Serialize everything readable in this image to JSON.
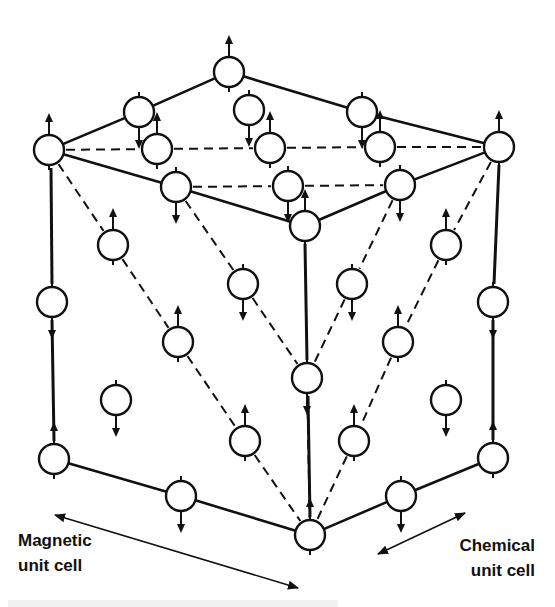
{
  "diagram": {
    "type": "crystal-spin-structure",
    "stroke_color": "#111111",
    "background": "#ffffff",
    "atom_radius": 15,
    "atoms": [
      {
        "x": 229,
        "y": 72,
        "spin": "up"
      },
      {
        "x": 139,
        "y": 112,
        "spin": "down"
      },
      {
        "x": 249,
        "y": 110,
        "spin": "down"
      },
      {
        "x": 362,
        "y": 112,
        "spin": "down"
      },
      {
        "x": 49,
        "y": 150,
        "spin": "up"
      },
      {
        "x": 157,
        "y": 149,
        "spin": "up"
      },
      {
        "x": 270,
        "y": 148,
        "spin": "up"
      },
      {
        "x": 380,
        "y": 147,
        "spin": "up"
      },
      {
        "x": 499,
        "y": 147,
        "spin": "up"
      },
      {
        "x": 176,
        "y": 187,
        "spin": "down"
      },
      {
        "x": 288,
        "y": 186,
        "spin": "down"
      },
      {
        "x": 400,
        "y": 185,
        "spin": "down"
      },
      {
        "x": 305,
        "y": 226,
        "spin": "up"
      },
      {
        "x": 113,
        "y": 245,
        "spin": "up"
      },
      {
        "x": 446,
        "y": 245,
        "spin": "up"
      },
      {
        "x": 243,
        "y": 284,
        "spin": "down"
      },
      {
        "x": 352,
        "y": 284,
        "spin": "down"
      },
      {
        "x": 52,
        "y": 302,
        "spin": "down"
      },
      {
        "x": 493,
        "y": 302,
        "spin": "down"
      },
      {
        "x": 178,
        "y": 342,
        "spin": "up"
      },
      {
        "x": 398,
        "y": 342,
        "spin": "up"
      },
      {
        "x": 307,
        "y": 378,
        "spin": "down"
      },
      {
        "x": 116,
        "y": 400,
        "spin": "down"
      },
      {
        "x": 446,
        "y": 400,
        "spin": "down"
      },
      {
        "x": 245,
        "y": 441,
        "spin": "up"
      },
      {
        "x": 354,
        "y": 441,
        "spin": "up"
      },
      {
        "x": 54,
        "y": 459,
        "spin": "up"
      },
      {
        "x": 493,
        "y": 458,
        "spin": "up"
      },
      {
        "x": 181,
        "y": 496,
        "spin": "down"
      },
      {
        "x": 401,
        "y": 496,
        "spin": "down"
      },
      {
        "x": 310,
        "y": 535,
        "spin": "up"
      }
    ],
    "solid_lines": [
      [
        49,
        150,
        139,
        112
      ],
      [
        139,
        112,
        229,
        72
      ],
      [
        229,
        72,
        362,
        112
      ],
      [
        362,
        112,
        499,
        147
      ],
      [
        49,
        150,
        176,
        187
      ],
      [
        176,
        187,
        305,
        226
      ],
      [
        305,
        226,
        400,
        185
      ],
      [
        400,
        185,
        499,
        147
      ],
      [
        54,
        459,
        181,
        496
      ],
      [
        181,
        496,
        310,
        535
      ],
      [
        310,
        535,
        401,
        496
      ],
      [
        401,
        496,
        493,
        458
      ]
    ],
    "dashed_lines": [
      [
        49,
        150,
        157,
        149
      ],
      [
        157,
        149,
        270,
        148
      ],
      [
        270,
        148,
        380,
        147
      ],
      [
        380,
        147,
        499,
        147
      ],
      [
        176,
        187,
        288,
        186
      ],
      [
        288,
        186,
        400,
        185
      ],
      [
        49,
        150,
        113,
        245
      ],
      [
        113,
        245,
        178,
        342
      ],
      [
        178,
        342,
        245,
        441
      ],
      [
        245,
        441,
        310,
        535
      ],
      [
        499,
        147,
        446,
        245
      ],
      [
        446,
        245,
        398,
        342
      ],
      [
        398,
        342,
        354,
        441
      ],
      [
        354,
        441,
        310,
        535
      ],
      [
        176,
        187,
        243,
        284
      ],
      [
        243,
        284,
        307,
        378
      ],
      [
        307,
        378,
        310,
        535
      ],
      [
        400,
        185,
        352,
        284
      ],
      [
        352,
        284,
        307,
        378
      ]
    ],
    "long_dash_lines": [
      [
        51,
        168,
        52,
        284
      ],
      [
        52,
        320,
        54,
        441
      ],
      [
        499,
        165,
        494,
        284
      ],
      [
        493,
        320,
        493,
        440
      ],
      [
        305,
        244,
        307,
        360
      ],
      [
        308,
        396,
        310,
        517
      ]
    ],
    "annotation_arrows": [
      {
        "name": "magnetic-unit-cell-arrow",
        "x1": 55,
        "y1": 515,
        "x2": 298,
        "y2": 588,
        "double": true
      },
      {
        "name": "chemical-unit-cell-arrow",
        "x1": 465,
        "y1": 513,
        "x2": 378,
        "y2": 554,
        "double": true
      }
    ]
  },
  "labels": {
    "magnetic_line1": "Magnetic",
    "magnetic_line2": "unit cell",
    "chemical_line1": "Chemical",
    "chemical_line2": "unit cell"
  }
}
